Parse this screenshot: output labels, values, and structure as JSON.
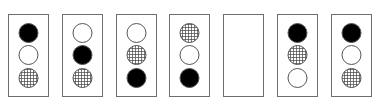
{
  "figure": {
    "fill_types": {
      "black": "solid black circle",
      "white": "hollow white circle",
      "hatch": "cross-hatched grid circle"
    },
    "panels": [
      {
        "label": "panel-1",
        "circles": [
          "black",
          "white",
          "hatch"
        ]
      },
      {
        "label": "panel-2",
        "circles": [
          "white",
          "black",
          "hatch"
        ]
      },
      {
        "label": "panel-3",
        "circles": [
          "white",
          "hatch",
          "black"
        ]
      },
      {
        "label": "panel-4",
        "circles": [
          "hatch",
          "white",
          "black"
        ]
      },
      {
        "label": "panel-5",
        "circles": [],
        "missing": true
      },
      {
        "label": "panel-6",
        "circles": [
          "black",
          "hatch",
          "white"
        ]
      },
      {
        "label": "panel-7",
        "circles": [
          "black",
          "white",
          "hatch"
        ]
      }
    ],
    "colors": {
      "stroke": "#555555",
      "fill_black": "#000000",
      "border": "#6e6e6e"
    }
  }
}
